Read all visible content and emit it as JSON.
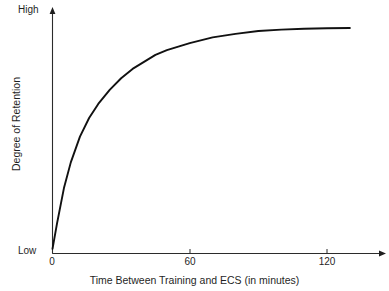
{
  "chart_data": {
    "type": "line",
    "title": "",
    "xlabel": "Time Between Training and ECS (in minutes)",
    "ylabel": "Degree of Retention",
    "xlim": [
      0,
      140
    ],
    "ylim": [
      0,
      1
    ],
    "xticks": [
      0,
      60,
      120
    ],
    "xticklabels": [
      "0",
      "60",
      "120"
    ],
    "yticklabels": [
      "Low",
      "High"
    ],
    "ytick_low_label": "Low",
    "ytick_high_label": "High",
    "grid": false,
    "legend": null,
    "series": [
      {
        "name": "Degree of Retention",
        "x": [
          0,
          2,
          5,
          8,
          12,
          16,
          20,
          25,
          30,
          35,
          40,
          45,
          50,
          55,
          60,
          70,
          80,
          90,
          100,
          110,
          120,
          130
        ],
        "y": [
          0.02,
          0.13,
          0.28,
          0.39,
          0.5,
          0.58,
          0.64,
          0.7,
          0.75,
          0.79,
          0.82,
          0.85,
          0.87,
          0.885,
          0.9,
          0.925,
          0.94,
          0.952,
          0.958,
          0.962,
          0.964,
          0.965
        ]
      }
    ],
    "annotations": [],
    "line_color": "#111111",
    "axis_color": "#1f1f1f",
    "background_color": "#ffffff"
  },
  "figure": {
    "y_axis_top_marker": "arrow",
    "x_axis_right_marker": "arrow"
  }
}
